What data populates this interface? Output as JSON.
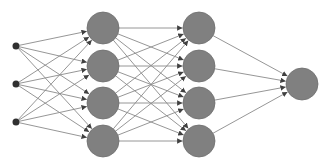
{
  "diagram": {
    "type": "feedforward-neural-network",
    "colors": {
      "background": "#ffffff",
      "node_fill": "#808080",
      "node_stroke": "#6e6e6e",
      "input_fill": "#303030",
      "edge": "#8a8a8a",
      "arrow": "#404040"
    },
    "layers": [
      {
        "name": "input",
        "node_count": 3,
        "x": 16,
        "ys": [
          46,
          84,
          122
        ],
        "radius": 3.5
      },
      {
        "name": "hidden-1",
        "node_count": 4,
        "x": 103,
        "ys": [
          28,
          66,
          103,
          141
        ],
        "radius": 16
      },
      {
        "name": "hidden-2",
        "node_count": 4,
        "x": 199,
        "ys": [
          28,
          66,
          103,
          141
        ],
        "radius": 16
      },
      {
        "name": "output",
        "node_count": 1,
        "x": 302,
        "ys": [
          84
        ],
        "radius": 16
      }
    ],
    "connectivity": "fully-connected"
  }
}
